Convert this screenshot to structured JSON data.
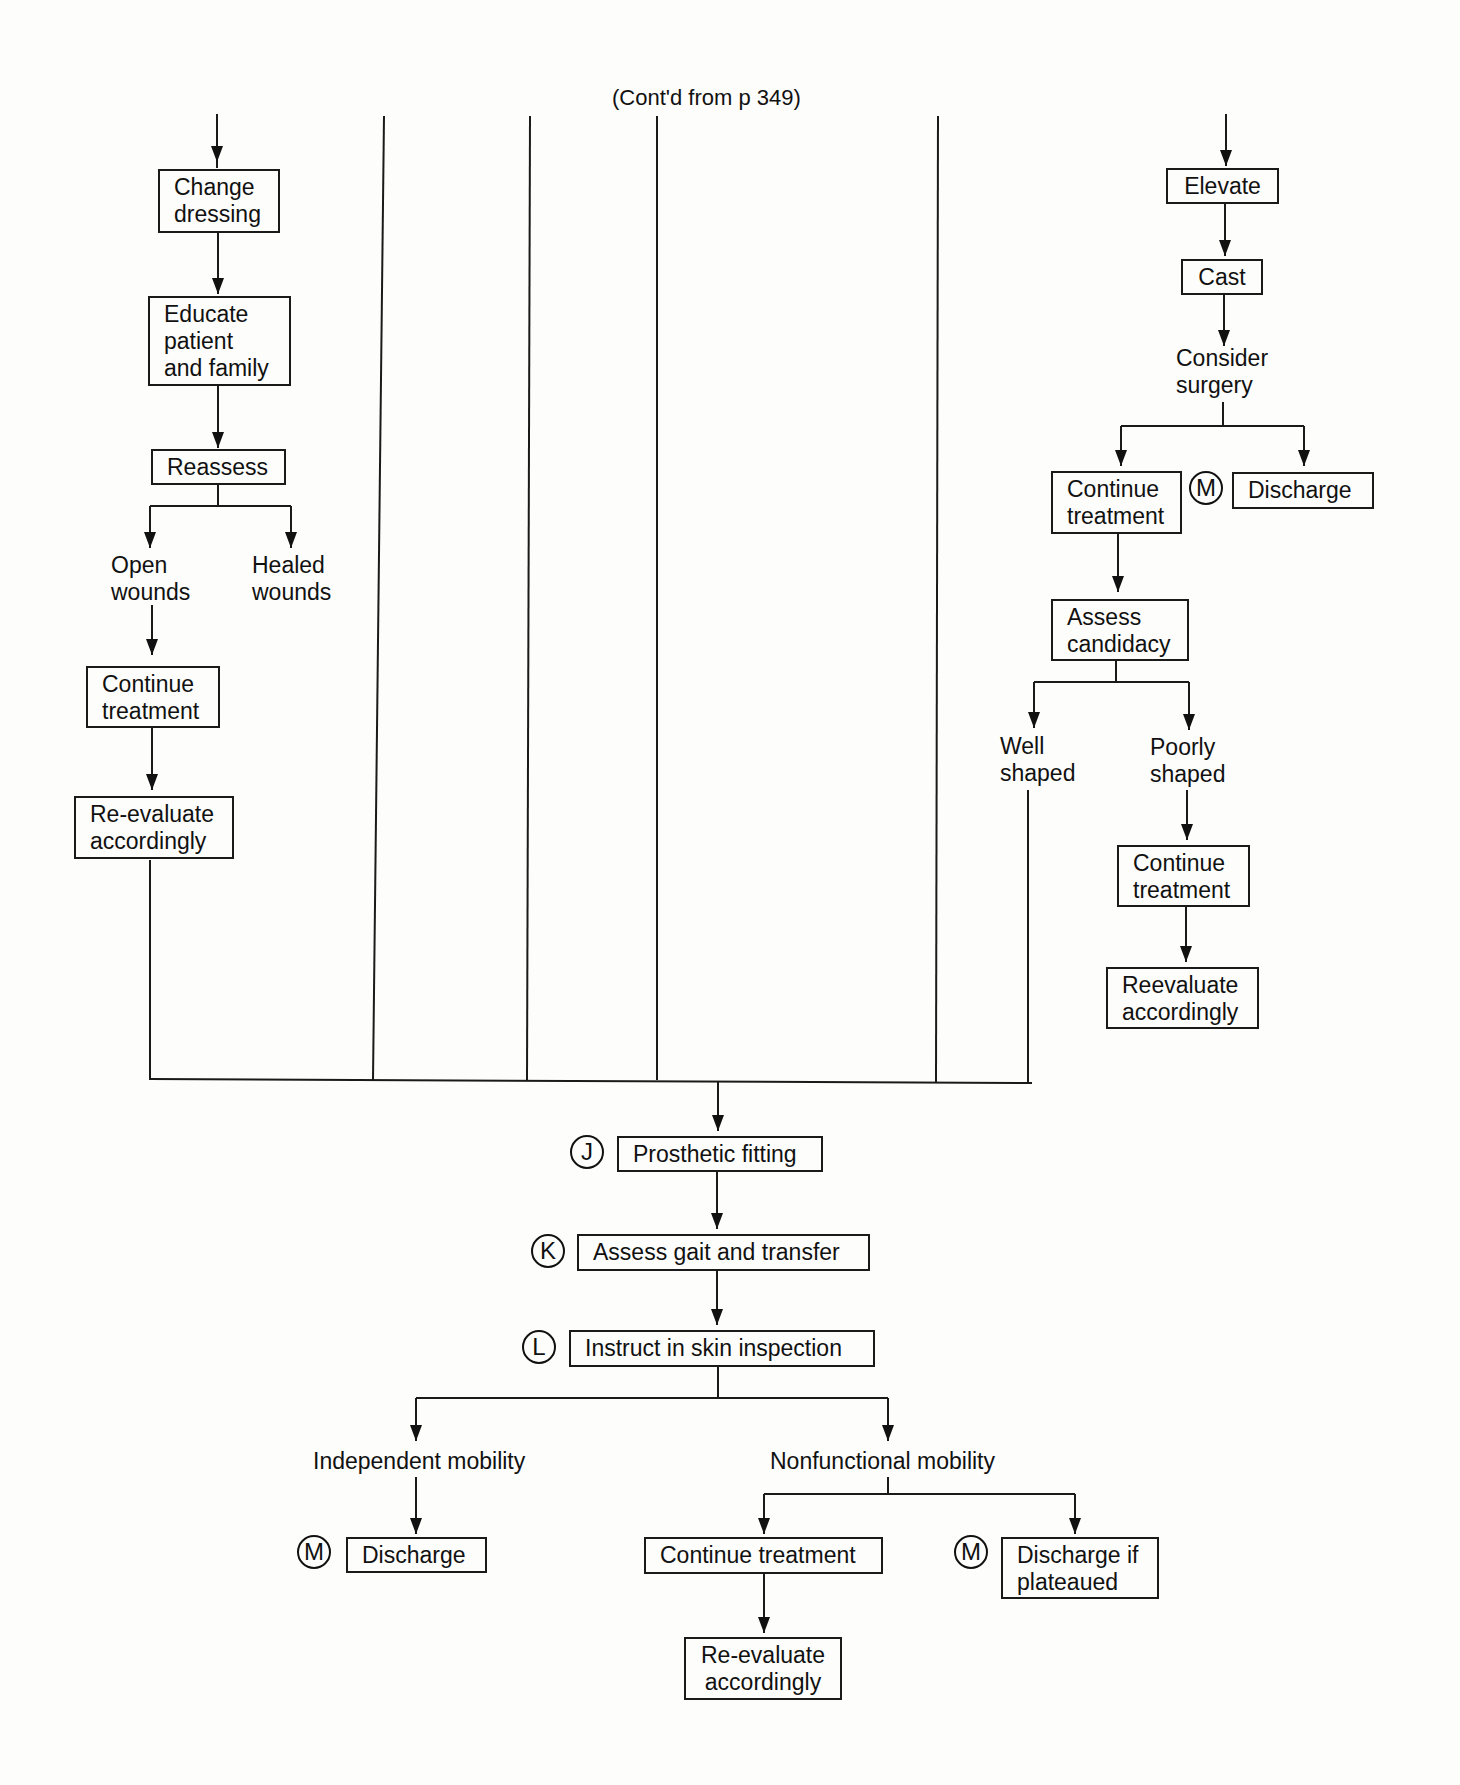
{
  "header": {
    "continuation": "(Cont'd from p 349)"
  },
  "left_branch": {
    "change_dressing": "Change\ndressing",
    "educate": "Educate\npatient\nand family",
    "reassess": "Reassess",
    "open_wounds": "Open\nwounds",
    "healed_wounds": "Healed\nwounds",
    "continue_treatment": "Continue\ntreatment",
    "reevaluate": "Re-evaluate\naccordingly"
  },
  "right_branch": {
    "elevate": "Elevate",
    "cast": "Cast",
    "consider_surgery": "Consider\nsurgery",
    "continue_treatment": "Continue\ntreatment",
    "discharge_marker": "M",
    "discharge": "Discharge",
    "assess_candidacy": "Assess\ncandidacy",
    "well_shaped": "Well\nshaped",
    "poorly_shaped": "Poorly\nshaped",
    "continue_treatment_2": "Continue\ntreatment",
    "reevaluate": "Reevaluate\naccordingly"
  },
  "main_flow": {
    "prosthetic_marker": "J",
    "prosthetic_fitting": "Prosthetic fitting",
    "gait_marker": "K",
    "assess_gait": "Assess gait and transfer",
    "skin_marker": "L",
    "instruct_skin": "Instruct in skin inspection",
    "independent_mobility": "Independent mobility",
    "nonfunctional_mobility": "Nonfunctional mobility",
    "discharge_marker": "M",
    "discharge": "Discharge",
    "continue_treatment": "Continue treatment",
    "reevaluate": "Re-evaluate\naccordingly",
    "plateau_marker": "M",
    "discharge_if_plateaued": "Discharge if\nplateaued"
  }
}
